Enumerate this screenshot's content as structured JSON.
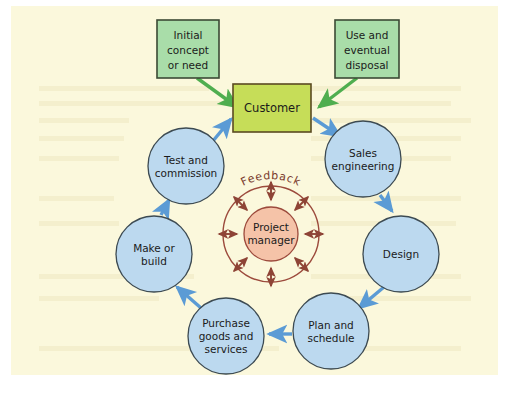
{
  "figure": {
    "panel_background": "#fbf8dc",
    "page_background": "#ffffff"
  },
  "colors": {
    "panel": "#fbf8dc",
    "circle_fill": "#bcd9ef",
    "circle_stroke": "#3c4a52",
    "blue_arrow": "#5b9bd5",
    "green_box_fill": "#a9dda9",
    "green_box_stroke": "#3b4a35",
    "green_arrow": "#4fae4f",
    "customer_fill": "#c6dd58",
    "customer_stroke": "#5a4a22",
    "center_ring_stroke": "#9c4a3c",
    "center_fill": "#f5c3a8",
    "center_arrow": "#8e4436",
    "text": "#1b1b1b"
  },
  "inputs": [
    {
      "id": "initial-concept",
      "lines": [
        "Initial",
        "concept",
        "or need"
      ],
      "x": 146,
      "y": 14,
      "w": 62,
      "h": 58
    },
    {
      "id": "use-disposal",
      "lines": [
        "Use and",
        "eventual",
        "disposal"
      ],
      "x": 324,
      "y": 14,
      "w": 64,
      "h": 58
    }
  ],
  "customer": {
    "id": "customer",
    "label": "Customer",
    "x": 222,
    "y": 78,
    "w": 78,
    "h": 48
  },
  "cycle": [
    {
      "id": "sales-engineering",
      "lines": [
        "Sales",
        "engineering"
      ],
      "cx": 352,
      "cy": 153,
      "r": 38
    },
    {
      "id": "design",
      "lines": [
        "Design"
      ],
      "cx": 390,
      "cy": 248,
      "r": 38
    },
    {
      "id": "plan-and-schedule",
      "lines": [
        "Plan and",
        "schedule"
      ],
      "cx": 320,
      "cy": 325,
      "r": 38
    },
    {
      "id": "purchase-goods-and-services",
      "lines": [
        "Purchase",
        "goods and",
        "services"
      ],
      "cx": 215,
      "cy": 330,
      "r": 38
    },
    {
      "id": "make-or-build",
      "lines": [
        "Make or",
        "build"
      ],
      "cx": 143,
      "cy": 248,
      "r": 38
    },
    {
      "id": "test-and-commission",
      "lines": [
        "Test and",
        "commission"
      ],
      "cx": 175,
      "cy": 160,
      "r": 38
    }
  ],
  "center": {
    "ring_label": "Feedback",
    "core_lines": [
      "Project",
      "manager"
    ],
    "cx": 260,
    "cy": 228,
    "outer_r": 48,
    "inner_r": 27,
    "spokes": 8
  },
  "flow_order": [
    "Customer",
    "Sales engineering",
    "Design",
    "Plan and schedule",
    "Purchase goods and services",
    "Make or build",
    "Test and commission",
    "Customer"
  ]
}
